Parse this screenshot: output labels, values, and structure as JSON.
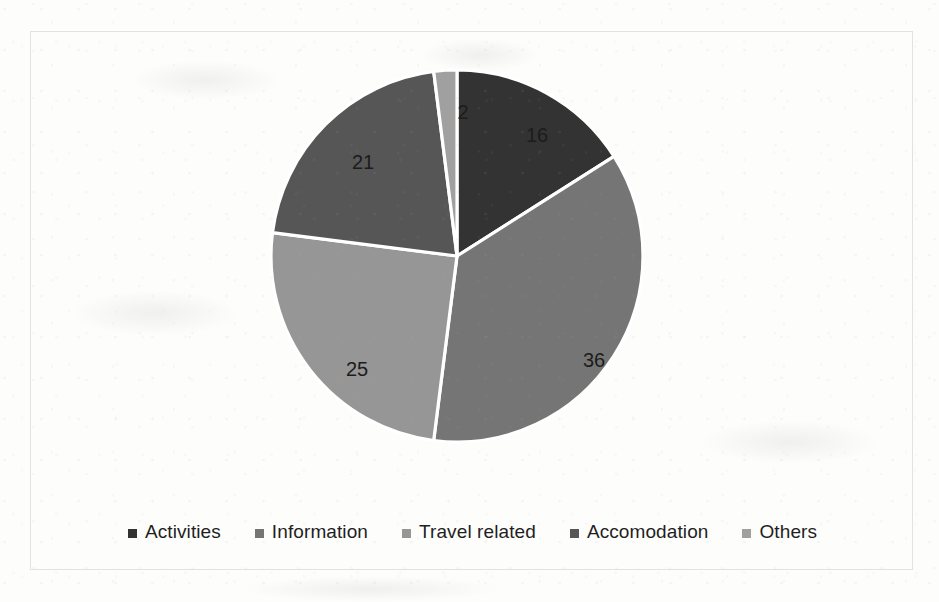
{
  "chart_data": {
    "type": "pie",
    "title": "",
    "subtitle": "",
    "xlabel": "",
    "ylabel": "",
    "grid": false,
    "legend_position": "bottom",
    "start_angle_deg": 0,
    "direction": "clockwise",
    "total": 100,
    "categories": [
      "Activities",
      "Information",
      "Travel related",
      "Accomodation",
      "Others"
    ],
    "values": [
      16,
      36,
      25,
      21,
      2
    ],
    "colors": [
      "#333333",
      "#757575",
      "#969696",
      "#565656",
      "#a0a0a0"
    ],
    "slices": [
      {
        "label": "Activities",
        "value": 16,
        "value_text": "16",
        "color": "#333333",
        "label_x": 536,
        "label_y": 136
      },
      {
        "label": "Information",
        "value": 36,
        "value_text": "36",
        "color": "#757575",
        "label_x": 593,
        "label_y": 361
      },
      {
        "label": "Travel related",
        "value": 25,
        "value_text": "25",
        "color": "#969696",
        "label_x": 356,
        "label_y": 370
      },
      {
        "label": "Accomodation",
        "value": 21,
        "value_text": "21",
        "color": "#565656",
        "label_x": 362,
        "label_y": 163
      },
      {
        "label": "Others",
        "value": 2,
        "value_text": "2",
        "color": "#a0a0a0",
        "label_x": 462,
        "label_y": 113
      }
    ]
  },
  "legend": {
    "items": [
      {
        "label": "Activities",
        "color": "#333333"
      },
      {
        "label": "Information",
        "color": "#757575"
      },
      {
        "label": "Travel related",
        "color": "#969696"
      },
      {
        "label": "Accomodation",
        "color": "#565656"
      },
      {
        "label": "Others",
        "color": "#a0a0a0"
      }
    ]
  },
  "style": {
    "frame_border_color": "#e2e2e2",
    "background_color": "#fdfdfc",
    "slice_separator_color": "#ffffff",
    "label_text_color": "#1c1c1c"
  }
}
